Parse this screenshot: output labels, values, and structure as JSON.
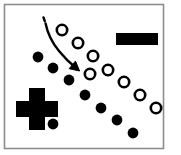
{
  "figure": {
    "title": "Two-class point distribution with class symbols and a curved decision-shift arrow",
    "canvas": {
      "width": 181,
      "height": 155,
      "background": "#ffffff"
    },
    "frame": {
      "name": "figure-border",
      "x": 4.5,
      "y": 4.5,
      "width": 159,
      "height": 144,
      "stroke": "#8d8d8d",
      "stroke_width": 1.6,
      "fill": "#ffffff"
    },
    "colors": {
      "ink": "#000000",
      "marker_fill_negative": "#ffffff",
      "marker_fill_positive": "#000000",
      "border": "#8d8d8d",
      "background": "#ffffff"
    },
    "legend_symbols": [
      {
        "name": "plus-symbol",
        "label": "+",
        "meaning": "positive-class",
        "shape": "plus",
        "center_x": 37,
        "center_y": 109,
        "arm_length": 42,
        "arm_thickness": 16,
        "fill": "#000000"
      },
      {
        "name": "minus-symbol",
        "label": "−",
        "meaning": "negative-class",
        "shape": "bar",
        "x": 116,
        "y": 33,
        "width": 42,
        "height": 12,
        "fill": "#000000"
      }
    ],
    "arrow": {
      "name": "curved-shift-arrow",
      "label": "shift direction",
      "style": "curved-with-dashed-tail",
      "dash_tail": {
        "d": "M 43.5 17.5 L 44.8 21.2"
      },
      "path": "M 45.6 23.4 C 47.4 32.5 52.0 42.5 59.0 51.0 C 64.5 57.8 70.5 63.6 76.3 68.3",
      "stroke_width": 2.4,
      "head": {
        "tip_x": 79.6,
        "tip_y": 71.0,
        "size": 9.5,
        "angle_deg": 40
      }
    },
    "series": [
      {
        "name": "positive-points",
        "label": "filled circles (positive class)",
        "marker": "filled-circle",
        "fill": "#000000",
        "stroke": "#000000",
        "radius": 5.4,
        "count": 8,
        "points": [
          {
            "x": 38,
            "y": 57
          },
          {
            "x": 53,
            "y": 68
          },
          {
            "x": 69,
            "y": 80
          },
          {
            "x": 85,
            "y": 95
          },
          {
            "x": 101,
            "y": 108
          },
          {
            "x": 117,
            "y": 120
          },
          {
            "x": 133,
            "y": 133
          },
          {
            "x": 53,
            "y": 124
          }
        ]
      },
      {
        "name": "negative-points",
        "label": "hollow circles (negative class)",
        "marker": "hollow-circle",
        "fill": "#ffffff",
        "stroke": "#000000",
        "radius": 5.2,
        "stroke_width": 2.6,
        "count": 8,
        "points": [
          {
            "x": 62,
            "y": 30
          },
          {
            "x": 78,
            "y": 43
          },
          {
            "x": 93,
            "y": 56
          },
          {
            "x": 90,
            "y": 74
          },
          {
            "x": 108,
            "y": 70
          },
          {
            "x": 124,
            "y": 82
          },
          {
            "x": 140,
            "y": 95
          },
          {
            "x": 156,
            "y": 108
          }
        ]
      }
    ]
  },
  "chart_data": {
    "type": "scatter",
    "xlabel": "",
    "ylabel": "",
    "grid": false,
    "legend": "none",
    "xlim": [
      0,
      181
    ],
    "ylim": [
      0,
      155
    ],
    "annotations": [
      {
        "text": "+",
        "role": "positive-class-symbol",
        "x": 37,
        "y": 109
      },
      {
        "text": "−",
        "role": "negative-class-symbol",
        "x": 137,
        "y": 39
      },
      {
        "text": "",
        "role": "curved-arrow",
        "from_x": 44,
        "from_y": 18,
        "to_x": 80,
        "to_y": 71
      }
    ],
    "series": [
      {
        "name": "filled circles (positive class)",
        "marker": "filled-circle",
        "x": [
          38,
          53,
          69,
          85,
          101,
          117,
          133,
          53
        ],
        "y": [
          57,
          68,
          80,
          95,
          108,
          120,
          133,
          124
        ]
      },
      {
        "name": "hollow circles (negative class)",
        "marker": "hollow-circle",
        "x": [
          62,
          78,
          93,
          90,
          108,
          124,
          140,
          156
        ],
        "y": [
          30,
          43,
          56,
          74,
          70,
          82,
          95,
          108
        ]
      }
    ]
  }
}
